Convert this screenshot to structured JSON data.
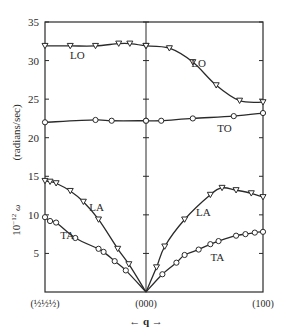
{
  "chart_data": {
    "type": "line",
    "title": "",
    "xlabel": "← q →",
    "ylabel": "10⁻¹² ω (radians/sec)",
    "ylabel_parts": {
      "prefix": "10",
      "exponent": "−12",
      "symbol": "ω",
      "unit": "(radians/sec)"
    },
    "ylim": [
      0,
      35
    ],
    "yticks": [
      5,
      10,
      15,
      20,
      25,
      30,
      35
    ],
    "grid": false,
    "x_ticks": [
      {
        "label": "(½½½)",
        "pos": -1
      },
      {
        "label": "(000)",
        "pos": 0
      },
      {
        "label": "(100)",
        "pos": 1
      }
    ],
    "x_description": "Reduced wave vector; left half from (½½½) to (000), right half from (000) to (100)",
    "series": [
      {
        "name": "LO",
        "marker": "triangle-down",
        "direction": "(½½½)",
        "points": [
          [
            -1.0,
            31.9
          ],
          [
            -0.75,
            31.9
          ],
          [
            -0.5,
            31.9
          ],
          [
            -0.27,
            32.2
          ],
          [
            -0.16,
            32.2
          ],
          [
            0.0,
            31.9
          ]
        ]
      },
      {
        "name": "LO",
        "marker": "triangle-down",
        "direction": "(100)",
        "points": [
          [
            0.0,
            31.9
          ],
          [
            0.2,
            31.6
          ],
          [
            0.4,
            29.8
          ],
          [
            0.6,
            26.8
          ],
          [
            0.8,
            24.8
          ],
          [
            1.0,
            24.6
          ]
        ]
      },
      {
        "name": "TO",
        "marker": "circle",
        "direction": "(½½½)",
        "points": [
          [
            -1.0,
            22.0
          ],
          [
            -0.5,
            22.3
          ],
          [
            -0.34,
            22.2
          ],
          [
            0.0,
            22.2
          ]
        ]
      },
      {
        "name": "TO",
        "marker": "circle",
        "direction": "(100)",
        "points": [
          [
            0.0,
            22.2
          ],
          [
            0.13,
            22.2
          ],
          [
            0.4,
            22.5
          ],
          [
            0.75,
            22.8
          ],
          [
            1.0,
            23.2
          ]
        ]
      },
      {
        "name": "LA",
        "marker": "triangle-down",
        "direction": "(½½½)",
        "points": [
          [
            -1.0,
            14.4
          ],
          [
            -0.95,
            14.3
          ],
          [
            -0.89,
            14.1
          ],
          [
            -0.75,
            13.1
          ],
          [
            -0.62,
            11.7
          ],
          [
            -0.47,
            9.4
          ],
          [
            -0.28,
            5.6
          ],
          [
            -0.17,
            3.6
          ],
          [
            0.0,
            0.0
          ]
        ]
      },
      {
        "name": "LA",
        "marker": "triangle-down",
        "direction": "(100)",
        "points": [
          [
            0.0,
            0.0
          ],
          [
            0.09,
            3.2
          ],
          [
            0.16,
            5.9
          ],
          [
            0.33,
            9.4
          ],
          [
            0.55,
            12.6
          ],
          [
            0.65,
            13.5
          ],
          [
            0.77,
            13.2
          ],
          [
            0.9,
            12.8
          ],
          [
            1.0,
            12.3
          ]
        ]
      },
      {
        "name": "TA",
        "marker": "circle",
        "direction": "(½½½)",
        "points": [
          [
            -1.0,
            9.7
          ],
          [
            -0.95,
            9.2
          ],
          [
            -0.89,
            9.0
          ],
          [
            -0.7,
            7.0
          ],
          [
            -0.47,
            5.6
          ],
          [
            -0.42,
            5.2
          ],
          [
            -0.31,
            4.0
          ],
          [
            -0.2,
            2.8
          ],
          [
            0.0,
            0.0
          ]
        ]
      },
      {
        "name": "TA",
        "marker": "circle",
        "direction": "(100)",
        "points": [
          [
            0.0,
            0.0
          ],
          [
            0.14,
            2.3
          ],
          [
            0.26,
            3.8
          ],
          [
            0.33,
            4.8
          ],
          [
            0.45,
            5.5
          ],
          [
            0.55,
            6.2
          ],
          [
            0.62,
            6.6
          ],
          [
            0.77,
            7.3
          ],
          [
            0.85,
            7.5
          ],
          [
            0.93,
            7.7
          ],
          [
            1.0,
            7.8
          ]
        ]
      }
    ],
    "annotations": [
      {
        "text": "LO",
        "x": -0.68,
        "y": 30.7
      },
      {
        "text": "LO",
        "x": 0.45,
        "y": 29.7
      },
      {
        "text": "TO",
        "x": 0.67,
        "y": 21.2
      },
      {
        "text": "LA",
        "x": -0.49,
        "y": 11.0
      },
      {
        "text": "LA",
        "x": 0.49,
        "y": 10.4
      },
      {
        "text": "TA",
        "x": -0.78,
        "y": 7.4
      },
      {
        "text": "TA",
        "x": 0.61,
        "y": 4.5
      }
    ]
  },
  "colors": {
    "ink": "#2a2a2a",
    "background": "#ffffff"
  }
}
